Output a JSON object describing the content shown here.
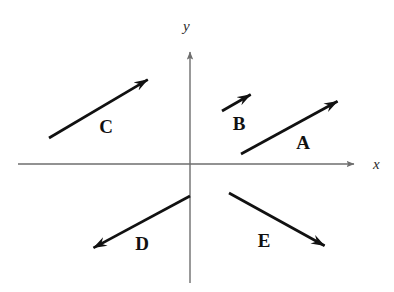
{
  "figure": {
    "background_color": "#ffffff",
    "axis_color": "#6e6e6e",
    "vector_color": "#111111",
    "width": 394,
    "height": 292
  },
  "axes": {
    "x": {
      "label": "x",
      "start": [
        18,
        164
      ],
      "end": [
        361,
        164
      ],
      "arrow": "right"
    },
    "y": {
      "label": "y",
      "start": [
        190,
        283
      ],
      "end": [
        190,
        45
      ],
      "arrow": "up"
    },
    "origin": [
      190,
      164
    ]
  },
  "vectors": [
    {
      "label": "A",
      "tail": [
        241,
        154
      ],
      "tip": [
        349,
        95
      ],
      "label_pos": [
        303,
        142
      ],
      "quadrant": "I",
      "direction": "up-right"
    },
    {
      "label": "B",
      "tail": [
        222,
        111
      ],
      "tip": [
        262,
        88
      ],
      "label_pos": [
        239,
        123
      ],
      "quadrant": "I",
      "direction": "up-right"
    },
    {
      "label": "C",
      "tail": [
        49,
        138
      ],
      "tip": [
        159,
        73
      ],
      "label_pos": [
        106,
        126
      ],
      "quadrant": "II",
      "direction": "up-right"
    },
    {
      "label": "D",
      "tail": [
        190,
        196
      ],
      "tip": [
        82,
        254
      ],
      "label_pos": [
        142,
        243
      ],
      "quadrant": "III",
      "direction": "down-left"
    },
    {
      "label": "E",
      "tail": [
        229,
        193
      ],
      "tip": [
        336,
        252
      ],
      "label_pos": [
        264,
        240
      ],
      "quadrant": "IV",
      "direction": "down-right"
    }
  ]
}
